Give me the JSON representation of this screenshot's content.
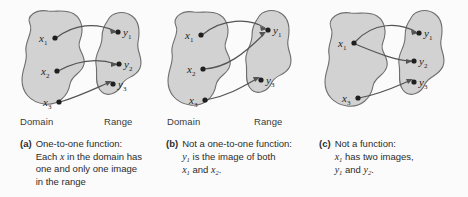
{
  "figure": {
    "background": "#fbfbfb",
    "blob_fill": "#d2d2d2",
    "blob_stroke": "#6e6e6e",
    "arrow_color": "#545454",
    "dot_color": "#1f1f1f"
  },
  "panels": [
    {
      "tag": "(a)",
      "domain_label": "Domain",
      "range_label": "Range",
      "caption_lines": [
        "One-to-one function:",
        "Each x in the domain has",
        "one and only one image",
        "in the range"
      ],
      "domain_points": [
        "x1",
        "x2",
        "x3"
      ],
      "range_points": [
        "y1",
        "y2",
        "y3"
      ],
      "mappings": [
        {
          "from": "x1",
          "to": "y1"
        },
        {
          "from": "x2",
          "to": "y2"
        },
        {
          "from": "x3",
          "to": "y3"
        }
      ]
    },
    {
      "tag": "(b)",
      "domain_label": "Domain",
      "range_label": "Range",
      "caption_lines": [
        "Not a one-to-one function:",
        "y1 is the image of both",
        "x1 and x2."
      ],
      "domain_points": [
        "x1",
        "x2",
        "x3"
      ],
      "range_points": [
        "y1",
        "y3"
      ],
      "mappings": [
        {
          "from": "x1",
          "to": "y1"
        },
        {
          "from": "x2",
          "to": "y1"
        },
        {
          "from": "x3",
          "to": "y3"
        }
      ]
    },
    {
      "tag": "(c)",
      "domain_label": "",
      "range_label": "",
      "caption_lines": [
        "Not a function:",
        "x1 has two images,",
        "y1 and y2."
      ],
      "domain_points": [
        "x1",
        "x3"
      ],
      "range_points": [
        "y1",
        "y2",
        "y3"
      ],
      "mappings": [
        {
          "from": "x1",
          "to": "y1"
        },
        {
          "from": "x1",
          "to": "y2"
        },
        {
          "from": "x3",
          "to": "y3"
        }
      ]
    }
  ],
  "captions": {
    "a": {
      "tag": "(a)",
      "l1": "One-to-one function:",
      "l2_pre": "Each ",
      "l2_var": "x",
      "l2_post": " in the domain has",
      "l3": "one and only one image",
      "l4": "in the range"
    },
    "b": {
      "tag": "(b)",
      "l1": "Not a one-to-one function:",
      "l2_var": "y",
      "l2_sub": "1",
      "l2_post": " is the image of both",
      "l3_var1": "x",
      "l3_sub1": "1",
      "l3_mid": " and ",
      "l3_var2": "x",
      "l3_sub2": "2",
      "l3_end": "."
    },
    "c": {
      "tag": "(c)",
      "l1": "Not a function:",
      "l2_var": "x",
      "l2_sub": "1",
      "l2_post": " has two images,",
      "l3_var1": "y",
      "l3_sub1": "1",
      "l3_mid": " and ",
      "l3_var2": "y",
      "l3_sub2": "2",
      "l3_end": "."
    }
  },
  "point_labels": {
    "x": "x",
    "y": "y",
    "s1": "1",
    "s2": "2",
    "s3": "3"
  },
  "set_labels": {
    "domain": "Domain",
    "range": "Range"
  }
}
